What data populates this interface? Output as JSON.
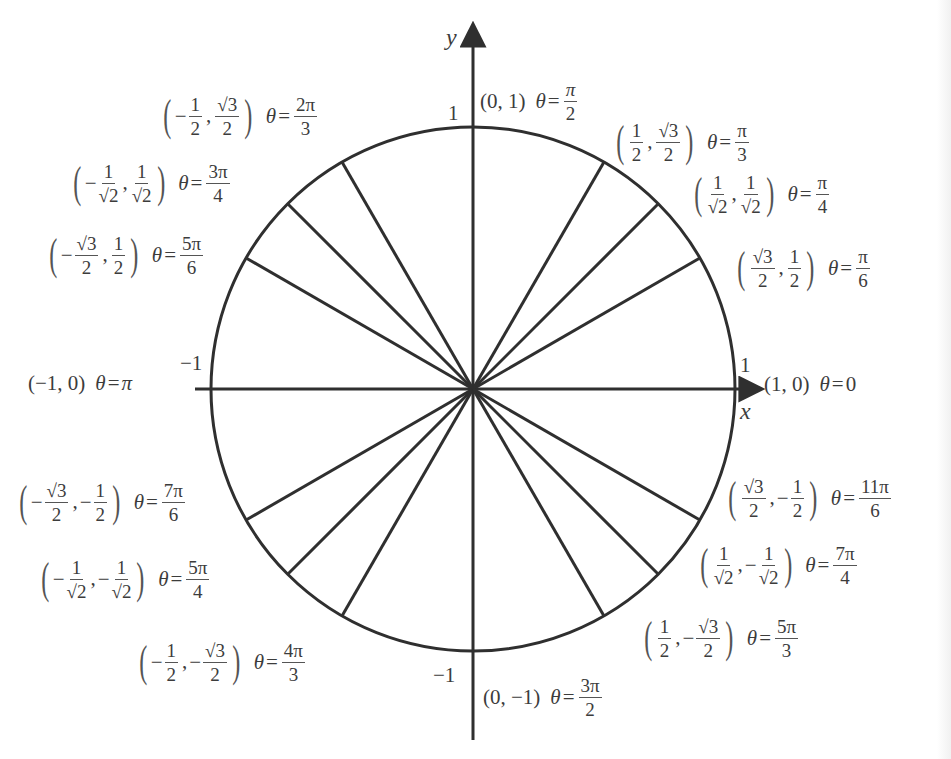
{
  "diagram": {
    "center_px": [
      473,
      389
    ],
    "radius_px": 262,
    "stroke_color": "#2f2f2f",
    "text_color": "#3c3c3c",
    "axes": {
      "x_label": "x",
      "y_label": "y",
      "x_ticks": {
        "neg": "−1",
        "pos": "1"
      },
      "y_ticks": {
        "neg": "−1",
        "pos": "1"
      }
    },
    "points": [
      {
        "angle_deg": 0,
        "x": "1",
        "y": "0",
        "theta": "0",
        "label": "(1, 0) θ=0"
      },
      {
        "angle_deg": 30,
        "x": "√3/2",
        "y": "1/2",
        "theta": "π/6"
      },
      {
        "angle_deg": 45,
        "x": "1/√2",
        "y": "1/√2",
        "theta": "π/4"
      },
      {
        "angle_deg": 60,
        "x": "1/2",
        "y": "√3/2",
        "theta": "π/3"
      },
      {
        "angle_deg": 90,
        "x": "0",
        "y": "1",
        "theta": "π/2",
        "label": "(0, 1) θ=π/2"
      },
      {
        "angle_deg": 120,
        "x": "−1/2",
        "y": "√3/2",
        "theta": "2π/3"
      },
      {
        "angle_deg": 135,
        "x": "−1/√2",
        "y": "1/√2",
        "theta": "3π/4"
      },
      {
        "angle_deg": 150,
        "x": "−√3/2",
        "y": "1/2",
        "theta": "5π/6"
      },
      {
        "angle_deg": 180,
        "x": "−1",
        "y": "0",
        "theta": "π",
        "label": "(−1, 0) θ=π"
      },
      {
        "angle_deg": 210,
        "x": "−√3/2",
        "y": "−1/2",
        "theta": "7π/6"
      },
      {
        "angle_deg": 225,
        "x": "−1/√2",
        "y": "−1/√2",
        "theta": "5π/4"
      },
      {
        "angle_deg": 240,
        "x": "−1/2",
        "y": "−√3/2",
        "theta": "4π/3"
      },
      {
        "angle_deg": 270,
        "x": "0",
        "y": "−1",
        "theta": "3π/2",
        "label": "(0, −1) θ=3π/2"
      },
      {
        "angle_deg": 300,
        "x": "1/2",
        "y": "−√3/2",
        "theta": "5π/3"
      },
      {
        "angle_deg": 315,
        "x": "1/√2",
        "y": "−1/√2",
        "theta": "7π/4"
      },
      {
        "angle_deg": 330,
        "x": "√3/2",
        "y": "−1/2",
        "theta": "11π/6"
      }
    ],
    "text": {
      "theta": "θ",
      "eq": "=",
      "lparen": "(",
      "rparen": ")",
      "comma": ",",
      "minus": "−",
      "one": "1",
      "two": "2",
      "three": "3",
      "four": "4",
      "six": "6",
      "sqrt3": "√3",
      "sqrt2": "√2",
      "pi": "π",
      "two_pi": "2π",
      "three_pi": "3π",
      "four_pi": "4π",
      "five_pi": "5π",
      "seven_pi": "7π",
      "eleven_pi": "11π",
      "p_1_0": "(1, 0)",
      "p_0_1": "(0, 1)",
      "p_m1_0": "(−1, 0)",
      "p_0_m1": "(0, −1)",
      "zero": "0"
    }
  }
}
